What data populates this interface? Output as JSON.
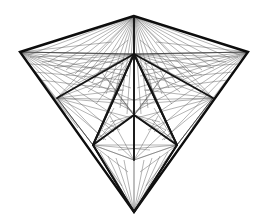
{
  "artwork": {
    "title": "Abstract Symmetric Line-Art Polygon",
    "description": "Inverted kite composed of straight line bundles radiating between vertices",
    "background_color": "#ffffff",
    "stroke_colors": {
      "thin": "#5a5a5a",
      "medium": "#3a3a3a",
      "bold": "#141414",
      "heavy": "#0d0d0d"
    },
    "canvas": {
      "width": 266,
      "height": 224
    }
  },
  "vertices": {
    "apex": {
      "x": 134,
      "y": 16
    },
    "left_corner": {
      "x": 20,
      "y": 52
    },
    "right_corner": {
      "x": 248,
      "y": 52
    },
    "bottom_tip": {
      "x": 134,
      "y": 212
    },
    "inner_left": {
      "x": 93,
      "y": 145
    },
    "inner_right": {
      "x": 177,
      "y": 145
    },
    "mid_left": {
      "x": 57,
      "y": 98
    },
    "mid_right": {
      "x": 213,
      "y": 98
    },
    "center": {
      "x": 134,
      "y": 115
    },
    "upper_center": {
      "x": 134,
      "y": 54
    },
    "lower_center": {
      "x": 134,
      "y": 160
    },
    "wing_left": {
      "x": 100,
      "y": 70
    },
    "wing_right": {
      "x": 168,
      "y": 70
    }
  },
  "fan_bundles": [
    {
      "name": "apex-to-left-edge",
      "origin": "apex",
      "count": 14,
      "color": "#5a5a5a"
    },
    {
      "name": "apex-to-right-edge",
      "origin": "apex",
      "count": 14,
      "color": "#5a5a5a"
    },
    {
      "name": "left-corner-fan",
      "origin": "left_corner",
      "count": 16,
      "color": "#5a5a5a"
    },
    {
      "name": "right-corner-fan",
      "origin": "right_corner",
      "count": 16,
      "color": "#5a5a5a"
    },
    {
      "name": "inner-left-fan",
      "origin": "inner_left",
      "count": 13,
      "color": "#5a5a5a"
    },
    {
      "name": "inner-right-fan",
      "origin": "inner_right",
      "count": 13,
      "color": "#5a5a5a"
    },
    {
      "name": "center-radial-fan",
      "origin": "center",
      "count": 18,
      "color": "#5a5a5a"
    },
    {
      "name": "bottom-tip-fan",
      "origin": "bottom_tip",
      "count": 12,
      "color": "#5a5a5a"
    },
    {
      "name": "upper-center-fan",
      "origin": "upper_center",
      "count": 16,
      "color": "#5a5a5a"
    }
  ],
  "outline_paths": [
    {
      "name": "outer-kite",
      "weight": "heavy"
    },
    {
      "name": "inner-diamond",
      "weight": "bold"
    },
    {
      "name": "central-spine",
      "weight": "bold"
    },
    {
      "name": "mid-chevron",
      "weight": "bold"
    }
  ]
}
